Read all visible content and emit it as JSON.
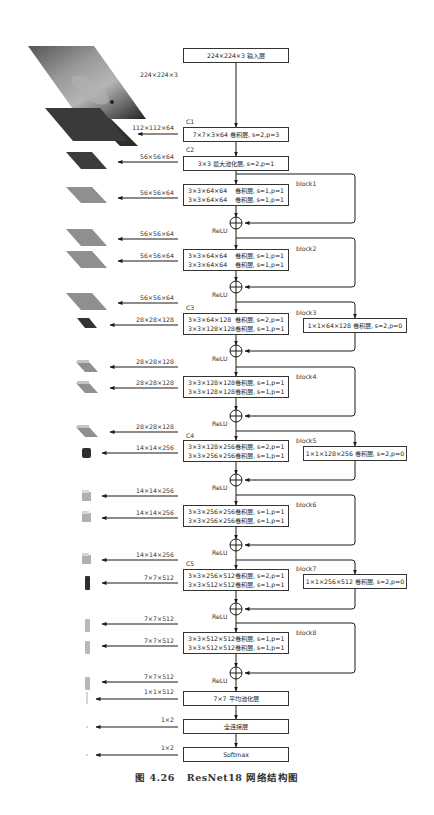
{
  "figure": {
    "caption_number": "图 4.26",
    "caption_title": "ResNet18 网络结构图"
  },
  "input": {
    "box_label": "224×224×3  输入层",
    "image_size_label": "224×224×3",
    "image_semantic": "cat-photo"
  },
  "stages": {
    "c1": {
      "tag": "C1",
      "label": "7×7×3×64  卷积层, s=2,p=3",
      "output": "112×112×64"
    },
    "c2": {
      "tag": "C2",
      "label": "3×3  最大池化层, s=2,p=1",
      "output": "56×56×64"
    },
    "c3": {
      "tag": "C3"
    },
    "c4": {
      "tag": "C4"
    },
    "c5": {
      "tag": "C5"
    }
  },
  "blocks": [
    {
      "name": "block1",
      "rows": [
        [
          "3×3×64×64",
          "卷积层, s=1,p=1"
        ],
        [
          "3×3×64×64",
          "卷积层, s=1,p=1"
        ]
      ],
      "in_label": "56×56×64",
      "relu": "ReLU"
    },
    {
      "name": "block2",
      "rows": [
        [
          "3×3×64×64",
          "卷积层, s=1,p=1"
        ],
        [
          "3×3×64×64",
          "卷积层, s=1,p=1"
        ]
      ],
      "pre_label": "56×56×64",
      "in_label": "56×56×64",
      "relu": "ReLU"
    },
    {
      "name": "block3",
      "rows": [
        [
          "3×3×64×128",
          "卷积层, s=2,p=1"
        ],
        [
          "3×3×128×128",
          "卷积层, s=1,p=1"
        ]
      ],
      "pre_label": "56×56×64",
      "in_label": "28×28×128",
      "relu": "ReLU",
      "shortcut": "1×1×64×128  卷积层, s=2,p=0"
    },
    {
      "name": "block4",
      "rows": [
        [
          "3×3×128×128",
          "卷积层, s=1,p=1"
        ],
        [
          "3×3×128×128",
          "卷积层, s=1,p=1"
        ]
      ],
      "pre_label": "28×28×128",
      "in_label": "28×28×128",
      "relu": "ReLU"
    },
    {
      "name": "block5",
      "rows": [
        [
          "3×3×128×256",
          "卷积层, s=2,p=1"
        ],
        [
          "3×3×256×256",
          "卷积层, s=1,p=1"
        ]
      ],
      "pre_label": "28×28×128",
      "in_label": "14×14×256",
      "relu": "ReLU",
      "shortcut": "1×1×128×256  卷积层, s=2,p=0"
    },
    {
      "name": "block6",
      "rows": [
        [
          "3×3×256×256",
          "卷积层, s=1,p=1"
        ],
        [
          "3×3×256×256",
          "卷积层, s=1,p=1"
        ]
      ],
      "pre_label": "14×14×256",
      "in_label": "14×14×256",
      "relu": "ReLU"
    },
    {
      "name": "block7",
      "rows": [
        [
          "3×3×256×512",
          "卷积层, s=2,p=1"
        ],
        [
          "3×3×512×512",
          "卷积层, s=1,p=1"
        ]
      ],
      "pre_label": "14×14×256",
      "in_label": "7×7×512",
      "relu": "ReLU",
      "shortcut": "1×1×256×512  卷积层, s=2,p=0"
    },
    {
      "name": "block8",
      "rows": [
        [
          "3×3×512×512",
          "卷积层, s=1,p=1"
        ],
        [
          "3×3×512×512",
          "卷积层, s=1,p=1"
        ]
      ],
      "pre_label": "7×7×512",
      "in_label": "7×7×512",
      "relu": "ReLU"
    }
  ],
  "head": {
    "pre_label": "7×7×512",
    "avgpool": {
      "label": "7×7  平均池化层",
      "output": "1×1×512"
    },
    "fc": {
      "label": "全连接层",
      "output": "1×2"
    },
    "softmax": {
      "label": "Softmax",
      "output": "1×2"
    }
  },
  "colors": {
    "line": "#1a1a1a",
    "box_border": "#333333",
    "map_dark": "#3a3a3a",
    "map_mid": "#8c8c8c",
    "map_light": "#bdbdbd"
  }
}
